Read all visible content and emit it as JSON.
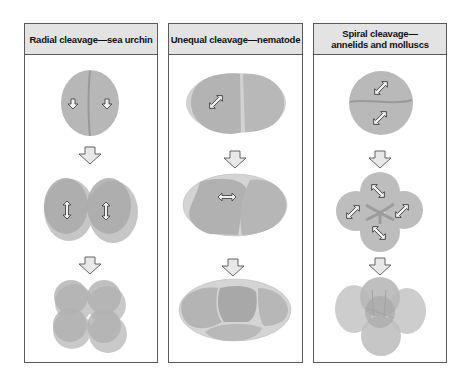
{
  "panels": [
    {
      "id": "radial",
      "title": "Radial cleavage—sea urchin",
      "organism": "sea urchin",
      "stages": [
        "2-cell",
        "4-cell (side view)",
        "8-cell"
      ]
    },
    {
      "id": "unequal",
      "title": "Unequal cleavage—nematode",
      "organism": "nematode",
      "stages": [
        "2-cell",
        "3-cell",
        "4+ cell"
      ]
    },
    {
      "id": "spiral",
      "title_line1": "Spiral cleavage—",
      "title_line2": "annelids and molluscs",
      "organism": "annelids and molluscs",
      "stages": [
        "2-cell",
        "4-cell",
        "8-cell"
      ]
    }
  ],
  "colors": {
    "cell_fill": "#b4b4b4",
    "cell_edge": "#9a9a9a",
    "header_bg": "#e3e3e3",
    "border": "#5a5a5a",
    "arrow_fill": "#e6e6e6"
  }
}
